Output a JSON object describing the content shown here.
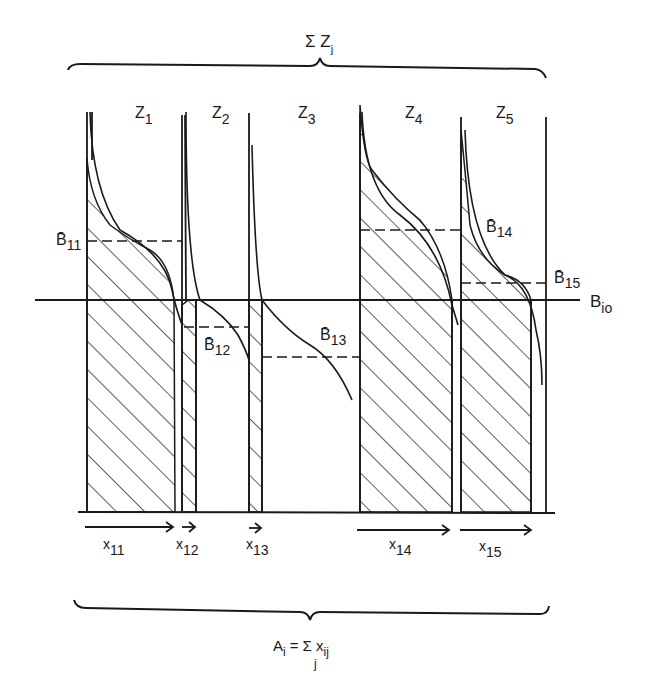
{
  "top_brace_label": {
    "main": "Σ Z",
    "sub": "j"
  },
  "columns": [
    {
      "label": "Z",
      "sub": "1"
    },
    {
      "label": "Z",
      "sub": "2"
    },
    {
      "label": "Z",
      "sub": "3"
    },
    {
      "label": "Z",
      "sub": "4"
    },
    {
      "label": "Z",
      "sub": "5"
    }
  ],
  "b_bar_labels": [
    {
      "main": "B̄",
      "sub": "11"
    },
    {
      "main": "B̄",
      "sub": "12"
    },
    {
      "main": "B̄",
      "sub": "13"
    },
    {
      "main": "B̄",
      "sub": "14"
    },
    {
      "main": "B̄",
      "sub": "15"
    }
  ],
  "baseline_label": {
    "main": "B",
    "sub": "io"
  },
  "x_labels": [
    {
      "main": "x",
      "sub": "11"
    },
    {
      "main": "x",
      "sub": "12"
    },
    {
      "main": "x",
      "sub": "13"
    },
    {
      "main": "x",
      "sub": "14"
    },
    {
      "main": "x",
      "sub": "15"
    }
  ],
  "bottom_brace_label": {
    "lhs": "A",
    "lhs_sub": "i",
    "eq": "= Σ x",
    "rhs_sub": "ij",
    "under": "j"
  },
  "colors": {
    "ink": "#1a1a1a",
    "background": "#ffffff"
  }
}
